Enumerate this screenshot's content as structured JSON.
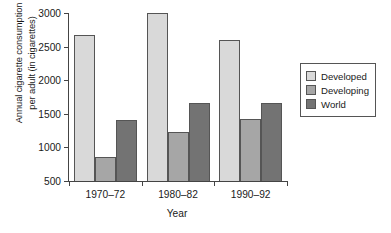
{
  "chart_data": {
    "type": "bar",
    "title": "",
    "categories": [
      "1970–72",
      "1980–82",
      "1990–92"
    ],
    "series": [
      {
        "name": "Developed",
        "values": [
          2670,
          3000,
          2600
        ],
        "color": "#d9d9d9"
      },
      {
        "name": "Developing",
        "values": [
          860,
          1230,
          1420
        ],
        "color": "#a6a6a6"
      },
      {
        "name": "World",
        "values": [
          1410,
          1660,
          1660
        ],
        "color": "#737373"
      }
    ],
    "xlabel": "Year",
    "ylabel": "Annual cigarette consumption per adult (in cigarettes)",
    "ylabel_line1": "Annual cigarette consumption",
    "ylabel_line2": "per adult (in cigarettes)",
    "ylim": [
      500,
      3000
    ],
    "yticks": [
      500,
      1000,
      1500,
      2000,
      2500,
      3000
    ],
    "ytick_labels": [
      "500",
      "1000",
      "1500",
      "2000",
      "2500",
      "3000"
    ],
    "grid": false,
    "legend_position": "right"
  }
}
